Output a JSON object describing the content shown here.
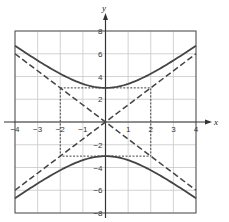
{
  "chart_data": {
    "type": "line",
    "title": "",
    "xlabel": "x",
    "ylabel": "y",
    "xlim": [
      -4,
      4
    ],
    "ylim": [
      -8,
      8
    ],
    "grid": true,
    "x_ticks": [
      -4,
      -3,
      -2,
      -1,
      1,
      2,
      3,
      4
    ],
    "y_ticks": [
      -8,
      -6,
      -4,
      -2,
      2,
      4,
      6,
      8
    ],
    "x_tick_labels": [
      "−4",
      "−3",
      "−2",
      "−1",
      "1",
      "2",
      "3",
      "4"
    ],
    "y_tick_labels": [
      "−8",
      "−6",
      "−4",
      "−2",
      "2",
      "4",
      "6",
      "8"
    ],
    "series": [
      {
        "name": "hyperbola upper branch",
        "style": "solid",
        "equation": "y = 3*sqrt(1 + x^2/4)",
        "x": [
          -4,
          -3,
          -2,
          -1,
          0,
          1,
          2,
          3,
          4
        ],
        "y": [
          6.71,
          5.41,
          4.24,
          3.35,
          3.0,
          3.35,
          4.24,
          5.41,
          6.71
        ]
      },
      {
        "name": "hyperbola lower branch",
        "style": "solid",
        "equation": "y = -3*sqrt(1 + x^2/4)",
        "x": [
          -4,
          -3,
          -2,
          -1,
          0,
          1,
          2,
          3,
          4
        ],
        "y": [
          -6.71,
          -5.41,
          -4.24,
          -3.35,
          -3.0,
          -3.35,
          -4.24,
          -5.41,
          -6.71
        ]
      },
      {
        "name": "asymptote y = 1.5x",
        "style": "dashed",
        "x": [
          -4,
          4
        ],
        "y": [
          -6,
          6
        ]
      },
      {
        "name": "asymptote y = -1.5x",
        "style": "dashed",
        "x": [
          -4,
          4
        ],
        "y": [
          6,
          -6
        ]
      },
      {
        "name": "central rectangle",
        "style": "dotted",
        "x": [
          -2,
          2,
          2,
          -2,
          -2
        ],
        "y": [
          3,
          3,
          -3,
          -3,
          3
        ]
      }
    ],
    "legend": null
  },
  "labels": {
    "x_axis": "x",
    "y_axis": "y"
  }
}
